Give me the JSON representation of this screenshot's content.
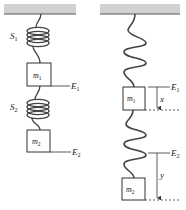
{
  "figure": {
    "left_panel": {
      "spring_labels": [
        "S₁",
        "S₂"
      ],
      "springs": [
        {
          "label": "S",
          "sub": "1"
        },
        {
          "label": "S",
          "sub": "2"
        }
      ],
      "masses": [
        {
          "label": "m",
          "sub": "1"
        },
        {
          "label": "m",
          "sub": "2"
        }
      ],
      "equilibrium_labels": [
        {
          "label": "E",
          "sub": "1"
        },
        {
          "label": "E",
          "sub": "2"
        }
      ]
    },
    "right_panel": {
      "masses": [
        {
          "label": "m",
          "sub": "1"
        },
        {
          "label": "m",
          "sub": "2"
        }
      ],
      "equilibrium_labels": [
        {
          "label": "E",
          "sub": "1"
        },
        {
          "label": "E",
          "sub": "2"
        }
      ],
      "displacements": [
        {
          "label": "x"
        },
        {
          "label": "y"
        }
      ]
    },
    "colors": {
      "ceiling": "#d2d2d2",
      "ceiling_edge": "#555555",
      "stroke": "#333333"
    }
  }
}
